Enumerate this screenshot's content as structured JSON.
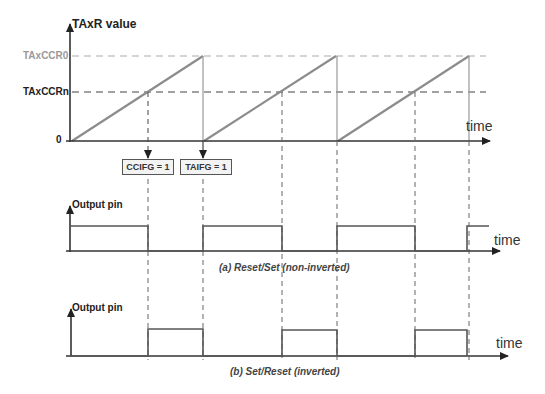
{
  "timer_graph": {
    "y_axis_label": "TAxR value",
    "ccr0_label": "TAxCCR0",
    "ccrn_label": "TAxCCRn",
    "zero_label": "0",
    "x_axis_label": "time",
    "flags": [
      {
        "label": "CCIFG = 1"
      },
      {
        "label": "TAIFG = 1"
      }
    ]
  },
  "output_a": {
    "y_axis_label": "Output pin",
    "x_axis_label": "time",
    "caption": "(a) Reset/Set (non-inverted)"
  },
  "output_b": {
    "y_axis_label": "Output pin",
    "x_axis_label": "time",
    "caption": "(b) Set/Reset (inverted)"
  },
  "colors": {
    "ramp": "#8c8c8c",
    "axis": "#333333",
    "ccr0_dash": "#aaaaaa",
    "ccrn_dash": "#444444"
  }
}
